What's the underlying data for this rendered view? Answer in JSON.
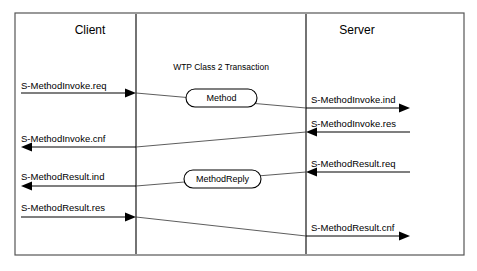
{
  "diagram": {
    "title": "WTP Class 2 Transaction",
    "lifelines": [
      {
        "name": "client",
        "label": "Client",
        "x": 136,
        "label_x": 90,
        "label_y": 34
      },
      {
        "name": "server",
        "label": "Server",
        "x": 306,
        "label_x": 357,
        "label_y": 34
      }
    ],
    "frame": {
      "x": 15,
      "y": 13,
      "width": 449,
      "height": 242
    },
    "title_pos": {
      "x": 221,
      "y": 70
    },
    "pdu_boxes": [
      {
        "name": "method",
        "label": "Method",
        "x": 186,
        "y": 89,
        "width": 71,
        "height": 18
      },
      {
        "name": "method-reply",
        "label": "MethodReply",
        "x": 184,
        "y": 170,
        "width": 77,
        "height": 18
      }
    ],
    "primitives": [
      {
        "name": "s-methodinvoke-req",
        "label": "S-MethodInvoke.req",
        "side": "left",
        "direction": "right",
        "text_x": 21,
        "text_y": 89,
        "line_y": 93,
        "from_x": 21,
        "to_x": 136
      },
      {
        "name": "s-methodinvoke-ind",
        "label": "S-MethodInvoke.ind",
        "side": "right",
        "direction": "right",
        "text_x": 311,
        "text_y": 103,
        "line_y": 108,
        "from_x": 306,
        "to_x": 410
      },
      {
        "name": "s-methodinvoke-res",
        "label": "S-MethodInvoke.res",
        "side": "right",
        "direction": "left",
        "text_x": 311,
        "text_y": 127,
        "line_y": 132,
        "from_x": 410,
        "to_x": 306
      },
      {
        "name": "s-methodinvoke-cnf",
        "label": "S-MethodInvoke.cnf",
        "side": "left",
        "direction": "left",
        "text_x": 21,
        "text_y": 142,
        "line_y": 147,
        "from_x": 136,
        "to_x": 21
      },
      {
        "name": "s-methodresult-req",
        "label": "S-MethodResult.req",
        "side": "right",
        "direction": "left",
        "text_x": 311,
        "text_y": 167,
        "line_y": 172,
        "from_x": 410,
        "to_x": 306
      },
      {
        "name": "s-methodresult-ind",
        "label": "S-MethodResult.ind",
        "side": "left",
        "direction": "left",
        "text_x": 21,
        "text_y": 180,
        "line_y": 186,
        "from_x": 136,
        "to_x": 21
      },
      {
        "name": "s-methodresult-res",
        "label": "S-MethodResult.res",
        "side": "left",
        "direction": "right",
        "text_x": 21,
        "text_y": 211,
        "line_y": 217,
        "from_x": 21,
        "to_x": 136
      },
      {
        "name": "s-methodresult-cnf",
        "label": "S-MethodResult.cnf",
        "side": "right",
        "direction": "right",
        "text_x": 311,
        "text_y": 231,
        "line_y": 236,
        "from_x": 306,
        "to_x": 410
      }
    ],
    "transfers": [
      {
        "name": "method-invoke-transfer",
        "from_x": 136,
        "from_y": 93,
        "to_x": 306,
        "to_y": 108
      },
      {
        "name": "method-invoke-ack-transfer",
        "from_x": 306,
        "from_y": 132,
        "to_x": 136,
        "to_y": 147
      },
      {
        "name": "method-result-transfer",
        "from_x": 306,
        "from_y": 172,
        "to_x": 136,
        "to_y": 186
      },
      {
        "name": "method-result-ack-transfer",
        "from_x": 136,
        "from_y": 217,
        "to_x": 306,
        "to_y": 236
      }
    ],
    "colors": {
      "stroke": "#000000",
      "frame": "#555555",
      "background": "#ffffff"
    }
  }
}
